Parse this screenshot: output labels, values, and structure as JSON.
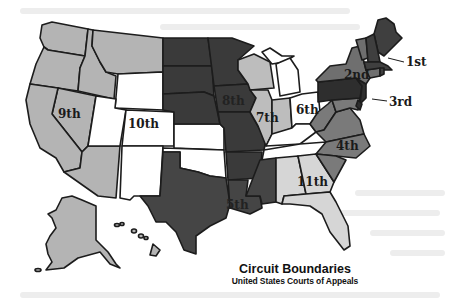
{
  "caption": {
    "title": "Circuit Boundaries",
    "subtitle": "United States Courts of Appeals"
  },
  "circuits": {
    "first": "1st",
    "second": "2nd",
    "third": "3rd",
    "fourth": "4th",
    "fifth": "5th",
    "sixth": "6th",
    "seventh": "7th",
    "eighth": "8th",
    "ninth": "9th",
    "tenth": "10th",
    "eleventh": "11th"
  },
  "colors": {
    "ninth": "#b4b4b4",
    "tenth": "#ffffff",
    "eighth": "#3a3a3a",
    "seventh": "#bdbdbd",
    "sixth": "#ffffff",
    "fifth": "#454545",
    "eleventh": "#d6d6d6",
    "fourth": "#7a7a7a",
    "third": "#2e2e2e",
    "second": "#6f6f6f",
    "first": "#3f3f3f",
    "outline": "#1c1c1c"
  }
}
